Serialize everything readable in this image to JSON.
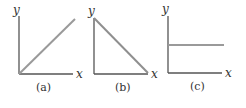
{
  "colors": {
    "axis": "#555555",
    "curve": "#9a9a9a",
    "text": "#333333"
  },
  "panels": [
    {
      "id": "a",
      "caption": "(a)",
      "x_label": "x",
      "y_label": "y",
      "curve": "increasing line through origin"
    },
    {
      "id": "b",
      "caption": "(b)",
      "x_label": "x",
      "y_label": "y",
      "curve": "decreasing line from top of y-axis to end of x-axis"
    },
    {
      "id": "c",
      "caption": "(c)",
      "x_label": "x",
      "y_label": "y",
      "curve": "horizontal constant line"
    }
  ]
}
